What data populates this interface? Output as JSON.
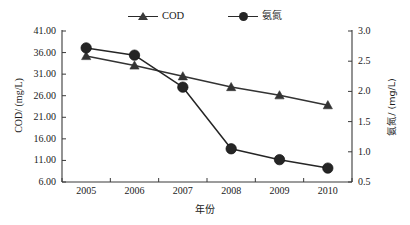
{
  "chart_data": {
    "type": "line",
    "title": "",
    "xlabel": "年份",
    "categories": [
      "2005",
      "2006",
      "2007",
      "2008",
      "2009",
      "2010"
    ],
    "x": [
      2005,
      2006,
      2007,
      2008,
      2009,
      2010
    ],
    "grid": false,
    "legend_position": "top-center",
    "axes": {
      "left": {
        "label": "COD/ (mg/L)",
        "ylim": [
          6.0,
          41.0
        ],
        "ticks": [
          6.0,
          11.0,
          16.0,
          21.0,
          26.0,
          31.0,
          36.0,
          41.0
        ],
        "tick_labels": [
          "6.00",
          "11.00",
          "16.00",
          "21.00",
          "26.00",
          "31.00",
          "36.00",
          "41.00"
        ]
      },
      "right": {
        "label": "氨氮/ (mg/L)",
        "ylim": [
          0.5,
          3.0
        ],
        "ticks": [
          0.5,
          1.0,
          1.5,
          2.0,
          2.5,
          3.0
        ],
        "tick_labels": [
          "0.5",
          "1.0",
          "1.5",
          "2.0",
          "2.5",
          "3.0"
        ]
      }
    },
    "series": [
      {
        "name": "COD",
        "axis": "left",
        "marker": "triangle",
        "color": "#333333",
        "values": [
          35.2,
          33.0,
          30.5,
          28.0,
          26.1,
          23.8
        ]
      },
      {
        "name": "氨氮",
        "axis": "right",
        "marker": "circle",
        "color": "#252525",
        "values": [
          2.72,
          2.6,
          2.07,
          1.05,
          0.87,
          0.73
        ]
      }
    ]
  },
  "legend": {
    "entries": [
      {
        "label": "COD",
        "marker": "triangle-marker-icon"
      },
      {
        "label": "氨氮",
        "marker": "circle-marker-icon"
      }
    ]
  },
  "labels": {
    "y_left_title": "COD/ (mg/L)",
    "y_right_title": "氨氮/ (mg/L)",
    "x_title": "年份"
  },
  "colors": {
    "axis": "#3a3a3a",
    "cod_line": "#333333",
    "nh3n_line": "#252525",
    "background": "#ffffff"
  }
}
